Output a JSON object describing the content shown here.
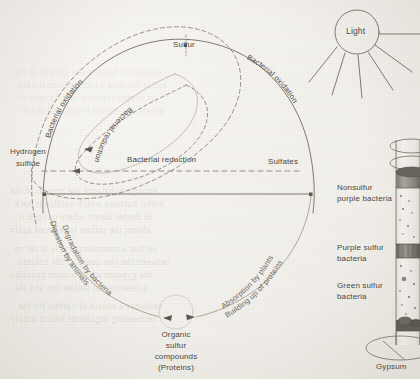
{
  "figure": {
    "type": "scientific-illustration"
  },
  "cycle": {
    "nodes": [
      {
        "id": "sulfur",
        "label": "Sulfur"
      },
      {
        "id": "hydrogen_sulfide",
        "label_line1": "Hydrogen",
        "label_line2": "sulfide"
      },
      {
        "id": "sulfates",
        "label": "Sulfates"
      },
      {
        "id": "organic",
        "label_line1": "Organic",
        "label_line2": "sulfur",
        "label_line3": "compounds",
        "label_line4": "(Proteins)"
      }
    ],
    "arcs": [
      {
        "id": "bacterial-oxidation-left",
        "label": "Bacterial oxidation"
      },
      {
        "id": "bacterial-oxidation-right",
        "label": "Bacterial oxidation"
      },
      {
        "id": "bacterial-reduction-inner",
        "label": "Bacterial reduction"
      },
      {
        "id": "bacterial-reduction-horizontal",
        "label": "Bacterial reduction"
      },
      {
        "id": "degradation-by-bacteria",
        "label": "Degradation by bacteria"
      },
      {
        "id": "digestion-by-animals",
        "label": "Digestion by animals"
      },
      {
        "id": "absorption-by-plants",
        "label": "Absorption by plants"
      },
      {
        "id": "building-up-of-proteins",
        "label": "Building up of proteins"
      }
    ]
  },
  "column": {
    "light_label": "Light",
    "layers": [
      {
        "id": "nonsulfur-purple-bacteria",
        "label_line1": "Nonsulfur",
        "label_line2": "purple bacteria"
      },
      {
        "id": "purple-sulfur-bacteria",
        "label_line1": "Purple sulfur",
        "label_line2": "bacteria"
      },
      {
        "id": "green-sulfur-bacteria",
        "label_line1": "Green sulfur",
        "label_line2": "bacteria"
      }
    ],
    "base_label": "Gypsum"
  },
  "colors": {
    "ink": "#4a4640",
    "line": "#6a645b",
    "line_faint": "#8e887d",
    "paper": "#f4f2ee",
    "bleed": "rgba(120,112,100,.17)"
  },
  "bleed_text": {
    "lines": [
      "enough to balance the growth of the",
      "sulfur bacteria which oxidize it back",
      "in deeper layers where oxygen is",
      "absent the sulfate is reduced again",
      "so that a continuous cycle is set up",
      "between the two zones of the column",
      "the gypsum at the bottom provides",
      "a reservoir of sulfate ion and the",
      "cellulose a source of carbon for the",
      "fermenting organisms which supply"
    ]
  }
}
